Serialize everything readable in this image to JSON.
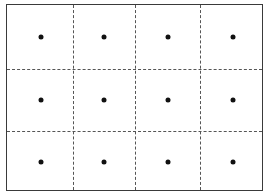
{
  "diagram": {
    "type": "grid-of-points",
    "rows": 3,
    "columns": 4,
    "border_color": "#3a3a3a",
    "divider_style": "dashed",
    "divider_color": "#555555",
    "dot_color": "#111111",
    "vertical_dividers_px": [
      66,
      128,
      193
    ],
    "horizontal_dividers_px": [
      64,
      126
    ],
    "dot_columns_px": [
      34,
      97,
      161,
      226
    ],
    "dot_rows_px": [
      32,
      95,
      157
    ]
  }
}
